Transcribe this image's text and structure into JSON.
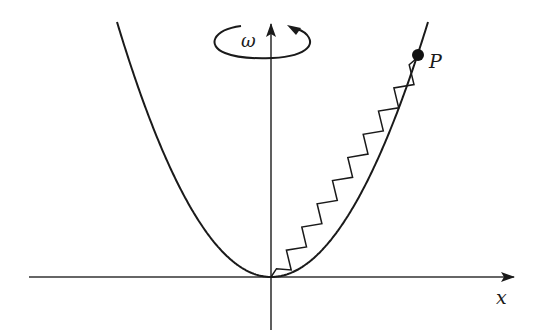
{
  "diagram": {
    "title": "",
    "labels": {
      "omega": "ω",
      "point": "P",
      "x_axis": "x"
    },
    "elements": [
      {
        "id": "x-axis",
        "type": "arrow",
        "from": [
          29,
          277
        ],
        "to": [
          514,
          277
        ]
      },
      {
        "id": "y-axis",
        "type": "arrow",
        "from": [
          271,
          330
        ],
        "to": [
          271,
          24
        ]
      },
      {
        "id": "parabola",
        "type": "curve",
        "vertex": [
          271,
          277
        ],
        "left_end": [
          117,
          22
        ],
        "right_end": [
          428,
          22
        ]
      },
      {
        "id": "rotation-ellipse",
        "type": "ellipse-arrow",
        "center": [
          256,
          41
        ],
        "rx": 38,
        "ry": 13,
        "direction": "counter-clockwise (viewed)"
      },
      {
        "id": "spring",
        "type": "zigzag",
        "from": [
          275,
          272
        ],
        "to": [
          418,
          55
        ],
        "coils": 18
      },
      {
        "id": "mass-P",
        "type": "point",
        "at": [
          418,
          55
        ]
      }
    ],
    "colors": {
      "stroke": "#1a1a1a",
      "background": "#ffffff"
    }
  }
}
